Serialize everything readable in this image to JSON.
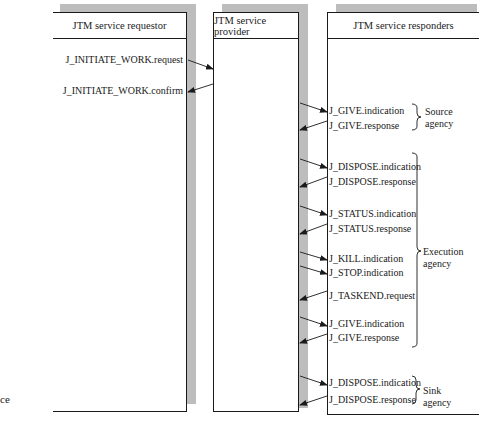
{
  "diagram": {
    "type": "service-primitive-sequence",
    "columns": [
      {
        "id": "requestor",
        "title": "JTM service requestor"
      },
      {
        "id": "provider",
        "title": "JTM service provider"
      },
      {
        "id": "responders",
        "title": "JTM service responders"
      }
    ],
    "requestor_primitives": [
      {
        "label": "J_INITIATE_WORK.request",
        "direction": "to-provider"
      },
      {
        "label": "J_INITIATE_WORK.confirm",
        "direction": "from-provider"
      }
    ],
    "responder_primitives": [
      {
        "label": "J_GIVE.indication",
        "direction": "from-provider"
      },
      {
        "label": "J_GIVE.response",
        "direction": "to-provider"
      },
      {
        "label": "J_DISPOSE.indication",
        "direction": "from-provider"
      },
      {
        "label": "J_DISPOSE.response",
        "direction": "to-provider"
      },
      {
        "label": "J_STATUS.indication",
        "direction": "from-provider"
      },
      {
        "label": "J_STATUS.response",
        "direction": "to-provider"
      },
      {
        "label": "J_KILL.indication",
        "direction": "from-provider"
      },
      {
        "label": "J_STOP.indication",
        "direction": "from-provider"
      },
      {
        "label": "J_TASKEND.request",
        "direction": "to-provider"
      },
      {
        "label": "J_GIVE.indication",
        "direction": "from-provider"
      },
      {
        "label": "J_GIVE.response",
        "direction": "to-provider"
      },
      {
        "label": "J_DISPOSE.indication",
        "direction": "from-provider"
      },
      {
        "label": "J_DISPOSE.response",
        "direction": "to-provider"
      }
    ],
    "agencies": [
      {
        "line1": "Source",
        "line2": "agency"
      },
      {
        "line1": "Execution",
        "line2": "agency"
      },
      {
        "line1": "Sink",
        "line2": "agency"
      }
    ],
    "cropped_fragment": "ce"
  }
}
